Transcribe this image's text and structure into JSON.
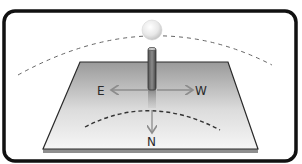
{
  "diagram": {
    "title": "",
    "labels": {
      "east": "E",
      "west": "W",
      "north": "N"
    },
    "elements": [
      "sun",
      "sun-path-arc",
      "ground-plane",
      "vertical-pole",
      "shadow",
      "direction-arrows",
      "shadow-tip-arc"
    ],
    "colors": {
      "frame": "#111111",
      "plane_top": "#9a9a9a",
      "plane_bottom": "#f4f4f4",
      "arrow": "#8c8c8c",
      "dash": "#555555",
      "sun": "#e6e6e6"
    }
  }
}
